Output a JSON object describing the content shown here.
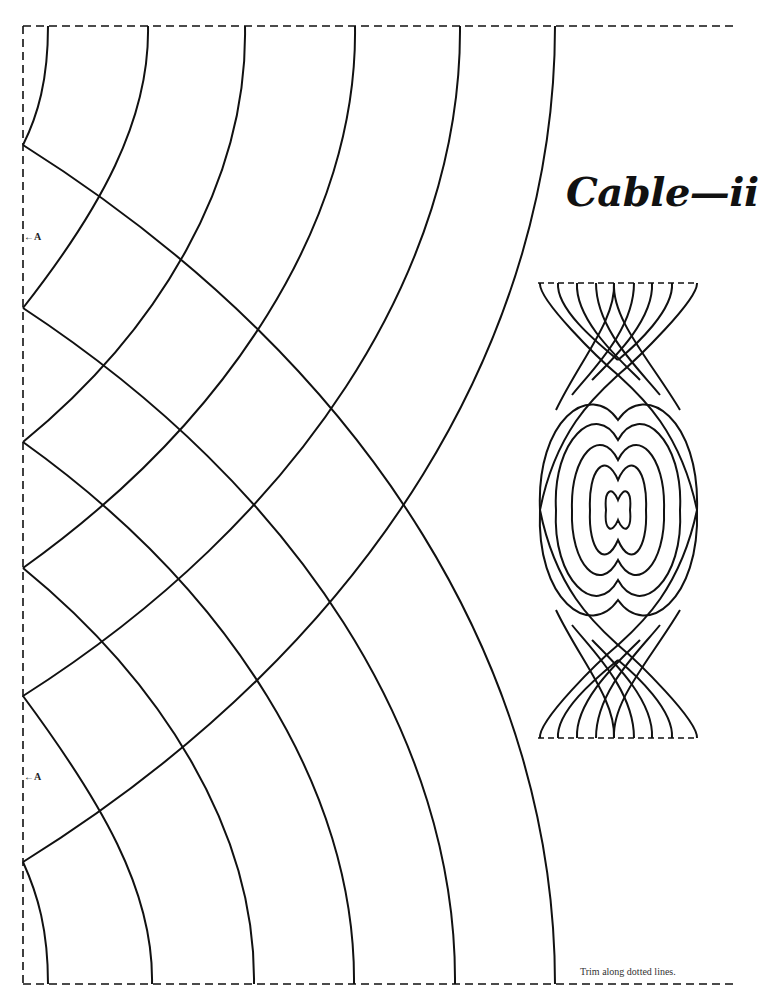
{
  "page": {
    "title": "Cable—ii",
    "trim_note": "Trim along dotted lines.",
    "markers": [
      {
        "label": "A",
        "icon": "left-arrow-icon",
        "y": 237
      },
      {
        "label": "A",
        "icon": "left-arrow-icon",
        "y": 777
      }
    ]
  },
  "colors": {
    "background": "#ffffff",
    "line": "#111111"
  }
}
